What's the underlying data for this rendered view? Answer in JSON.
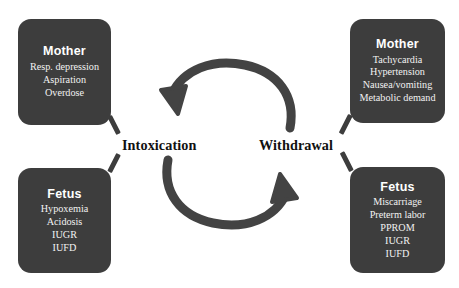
{
  "diagram": {
    "colors": {
      "box_fill": "#3d3d3d",
      "box_text": "#ffffff",
      "arrow": "#434343",
      "label_text": "#111111",
      "background": "#ffffff"
    },
    "center_labels": {
      "intoxication": "Intoxication",
      "withdrawal": "Withdrawal"
    },
    "arrows": [
      {
        "name": "top-arc-arrow",
        "from": "Withdrawal",
        "to": "Intoxication",
        "direction": "right-to-left",
        "head": "left"
      },
      {
        "name": "bottom-arc-arrow",
        "from": "Intoxication",
        "to": "Withdrawal",
        "direction": "left-to-right",
        "head": "right"
      }
    ],
    "boxes": [
      {
        "id": "mother-intoxication",
        "position": "top-left",
        "title": "Mother",
        "items": [
          "Resp. depression",
          "Aspiration",
          "Overdose"
        ]
      },
      {
        "id": "fetus-intoxication",
        "position": "bottom-left",
        "title": "Fetus",
        "items": [
          "Hypoxemia",
          "Acidosis",
          "IUGR",
          "IUFD"
        ]
      },
      {
        "id": "mother-withdrawal",
        "position": "top-right",
        "title": "Mother",
        "items": [
          "Tachycardia",
          "Hypertension",
          "Nausea/vomiting",
          "Metabolic demand"
        ]
      },
      {
        "id": "fetus-withdrawal",
        "position": "bottom-right",
        "title": "Fetus",
        "items": [
          "Miscarriage",
          "Preterm labor",
          "PPROM",
          "IUGR",
          "IUFD"
        ]
      }
    ]
  }
}
